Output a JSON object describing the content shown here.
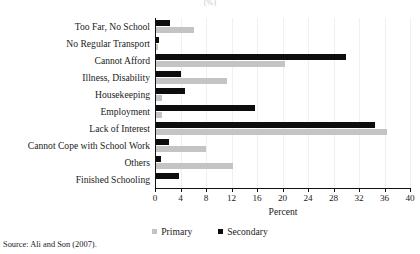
{
  "figure": {
    "top_title_partial": "(%)",
    "source_note": "Source: Ali and Son (2007)."
  },
  "legend": {
    "position": "bottom-center",
    "items": [
      {
        "label": "Primary",
        "color": "#c4c4c4",
        "swatch": "square-swatch-primary"
      },
      {
        "label": "Secondary",
        "color": "#0d0d0d",
        "swatch": "square-swatch-secondary"
      }
    ]
  },
  "chart_data": {
    "type": "bar",
    "orientation": "horizontal",
    "title": "(%)",
    "xlabel": "Percent",
    "ylabel": "",
    "xlim": [
      0,
      40
    ],
    "ylim": null,
    "grid": true,
    "xticks": [
      0,
      4,
      8,
      12,
      16,
      20,
      24,
      28,
      32,
      36,
      40
    ],
    "xtick_labels": [
      "0",
      "4",
      "8",
      "12",
      "16",
      "20",
      "24",
      "28",
      "32",
      "36",
      "40"
    ],
    "categories": [
      "Too Far, No School",
      "No Regular Transport",
      "Cannot Afford",
      "Illness, Disability",
      "Housekeeping",
      "Employment",
      "Lack of Interest",
      "Cannot Cope with School Work",
      "Others",
      "Finished Schooling"
    ],
    "series": [
      {
        "name": "Primary",
        "color": "#c4c4c4",
        "values": [
          6.0,
          0.3,
          20.3,
          11.2,
          0.9,
          0.9,
          36.3,
          7.8,
          12.0,
          0.0
        ]
      },
      {
        "name": "Secondary",
        "color": "#0d0d0d",
        "values": [
          2.2,
          0.4,
          29.8,
          3.9,
          4.5,
          15.6,
          34.4,
          2.0,
          0.8,
          3.6
        ]
      }
    ]
  }
}
